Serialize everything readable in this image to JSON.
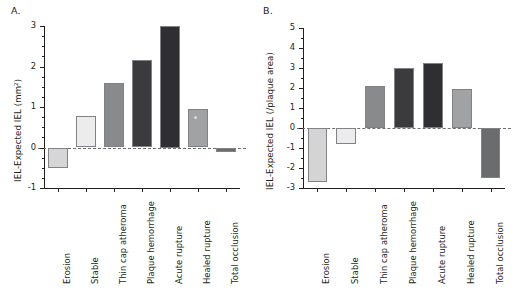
{
  "figure": {
    "panel_a_letter": "A.",
    "panel_b_letter": "B."
  },
  "chart_data": [
    {
      "type": "bar",
      "panel": "A.",
      "title": "",
      "xlabel": "",
      "ylabel": "IEL-Expected IEL (mm²)",
      "categories": [
        "Erosion",
        "Stable",
        "Thin cap atheroma",
        "Plaque hemorrhage",
        "Acute rupture",
        "Healed rupture",
        "Total occlusion"
      ],
      "values": [
        -0.5,
        0.78,
        1.6,
        2.15,
        3.0,
        0.95,
        -0.1
      ],
      "ylim": [
        -1,
        3
      ],
      "yticks": [
        -1,
        0,
        1,
        2,
        3
      ],
      "ytick_labels": [
        "-1",
        "0",
        "1",
        "2",
        "3"
      ],
      "minor_tick_interval": 0.25,
      "grid": false,
      "legend": "none",
      "zero_reference_line": true,
      "bar_colors": [
        "#d6d6d6",
        "#ececec",
        "#888a8c",
        "#3b3b3d",
        "#2f2f31",
        "#a0a2a4",
        "#6a6c6e"
      ]
    },
    {
      "type": "bar",
      "panel": "B.",
      "title": "",
      "xlabel": "",
      "ylabel": "IEL-Expected IEL (/plaque area)",
      "categories": [
        "Erosion",
        "Stable",
        "Thin cap atheroma",
        "Plaque hemorrhage",
        "Acute rupture",
        "Healed rupture",
        "Total occlusion"
      ],
      "values": [
        -2.7,
        -0.8,
        2.1,
        3.0,
        3.25,
        1.95,
        -2.5
      ],
      "ylim": [
        -3,
        5
      ],
      "yticks": [
        -3,
        -2,
        -1,
        0,
        1,
        2,
        3,
        4,
        5
      ],
      "ytick_labels": [
        "-3",
        "-2",
        "-1",
        "0",
        "1",
        "2",
        "3",
        "4",
        "5"
      ],
      "minor_tick_interval": 0.5,
      "grid": false,
      "legend": "none",
      "zero_reference_line": true,
      "bar_colors": [
        "#d4d4d4",
        "#ececec",
        "#888a8c",
        "#3b3b3d",
        "#2f2f31",
        "#a0a2a4",
        "#6a6c6e"
      ]
    }
  ]
}
